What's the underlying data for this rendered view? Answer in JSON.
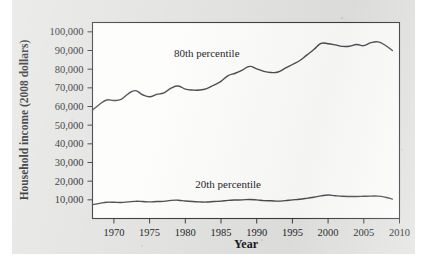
{
  "figure": {
    "background_color": "#e3e3e1",
    "plot_background_color": "#fdfdfc",
    "frame_color": "#3b3b42",
    "line_color": "#4a4a52"
  },
  "chart_data": {
    "type": "line",
    "title": "",
    "xlabel": "Year",
    "ylabel": "Household income (2008 dollars)",
    "xlim": [
      1967,
      2010
    ],
    "ylim": [
      0,
      105000
    ],
    "grid": false,
    "legend_position": "inline-annotation",
    "xticks": [
      1970,
      1975,
      1980,
      1985,
      1990,
      1995,
      2000,
      2005,
      2010
    ],
    "xtick_labels": [
      "1970",
      "1975",
      "1980",
      "1985",
      "1990",
      "1995",
      "2000",
      "2005",
      "2010"
    ],
    "yticks": [
      10000,
      20000,
      30000,
      40000,
      50000,
      60000,
      70000,
      80000,
      90000,
      100000
    ],
    "ytick_labels": [
      "10,000",
      "20,000",
      "30,000",
      "40,000",
      "50,000",
      "60,000",
      "70,000",
      "80,000",
      "90,000",
      "100,000"
    ],
    "x": [
      1967,
      1968,
      1969,
      1970,
      1971,
      1972,
      1973,
      1974,
      1975,
      1976,
      1977,
      1978,
      1979,
      1980,
      1981,
      1982,
      1983,
      1984,
      1985,
      1986,
      1987,
      1988,
      1989,
      1990,
      1991,
      1992,
      1993,
      1994,
      1995,
      1996,
      1997,
      1998,
      1999,
      2000,
      2001,
      2002,
      2003,
      2004,
      2005,
      2006,
      2007,
      2008,
      2009
    ],
    "series": [
      {
        "name": "80th percentile",
        "label": "80th percentile",
        "label_x": 1983,
        "label_y": 86500,
        "values": [
          58000,
          61200,
          63500,
          63200,
          63800,
          66800,
          68500,
          66300,
          65200,
          66500,
          67300,
          69800,
          71000,
          69300,
          68800,
          68800,
          69600,
          71500,
          73500,
          76500,
          77800,
          79500,
          81500,
          80200,
          78800,
          78200,
          78500,
          80500,
          82500,
          84500,
          87500,
          90500,
          93800,
          93600,
          93000,
          92200,
          92300,
          93200,
          92600,
          94200,
          94600,
          92800,
          90000
        ]
      },
      {
        "name": "20th percentile",
        "label": "20th percentile",
        "label_x": 1986,
        "label_y": 16500,
        "values": [
          7400,
          8100,
          8700,
          8700,
          8600,
          8900,
          9200,
          9100,
          8900,
          9100,
          9200,
          9700,
          9800,
          9400,
          9100,
          8900,
          8800,
          9100,
          9300,
          9700,
          9900,
          10000,
          10200,
          10000,
          9600,
          9500,
          9300,
          9600,
          10000,
          10300,
          10800,
          11400,
          12100,
          12600,
          12200,
          11900,
          11800,
          11800,
          11900,
          12000,
          12000,
          11400,
          10400
        ]
      }
    ]
  }
}
